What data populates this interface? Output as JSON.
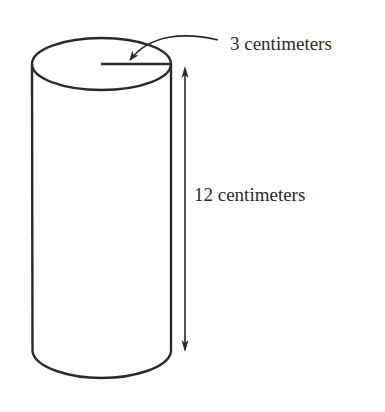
{
  "diagram": {
    "type": "geometry-figure",
    "shape": "cylinder",
    "labels": {
      "radius": "3 centimeters",
      "height": "12 centimeters"
    },
    "measurements": {
      "radius_cm": 3,
      "height_cm": 12
    },
    "colors": {
      "stroke": "#2a2a2a",
      "background": "#ffffff"
    }
  }
}
